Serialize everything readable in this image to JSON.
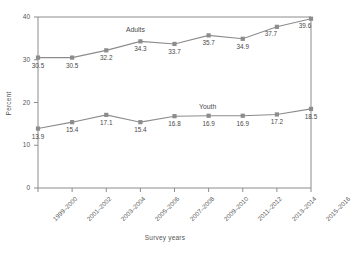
{
  "chart_data": {
    "type": "line",
    "title": "",
    "xlabel": "Survey years",
    "ylabel": "Percent",
    "ylim": [
      0,
      40
    ],
    "yticks": [
      0,
      10,
      20,
      30,
      40
    ],
    "grid": false,
    "legend_position": "inline-annotations",
    "categories": [
      "1999–2000",
      "2001–2002",
      "2003–2004",
      "2005–2006",
      "2007–2008",
      "2009–2010",
      "2011–2012",
      "2013–2014",
      "2015–2016"
    ],
    "series": [
      {
        "name": "Adults",
        "color": "#8c8c8c",
        "values": [
          30.5,
          30.5,
          32.2,
          34.3,
          33.7,
          35.7,
          34.9,
          37.7,
          39.6
        ],
        "labels": [
          "30.5",
          "30.5",
          "32.2",
          "34.3",
          "33.7",
          "35.7",
          "34.9",
          "37.7",
          "39.6"
        ]
      },
      {
        "name": "Youth",
        "color": "#8c8c8c",
        "values": [
          13.9,
          15.4,
          17.1,
          15.4,
          16.8,
          16.9,
          16.9,
          17.2,
          18.5
        ],
        "labels": [
          "13.9",
          "15.4",
          "17.1",
          "15.4",
          "16.8",
          "16.9",
          "16.9",
          "17.2",
          "18.5"
        ]
      }
    ],
    "annotations": [
      {
        "text": "Adults",
        "series": "Adults"
      },
      {
        "text": "Youth",
        "series": "Youth"
      }
    ]
  },
  "axis": {
    "y_tick_labels": [
      "40",
      "30",
      "20",
      "10",
      "0"
    ],
    "y_title": "Percent",
    "x_title": "Survey years"
  }
}
